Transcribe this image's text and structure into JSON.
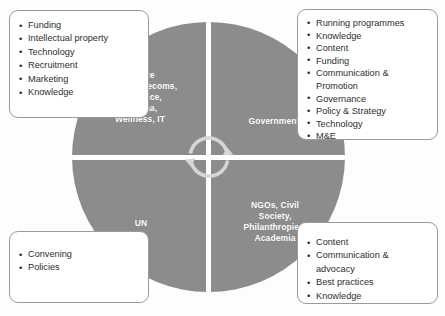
{
  "diagram": {
    "circle_color": "#8c8c8c",
    "divider_color": "#ffffff",
    "center_icon": "cycle-arrows-icon"
  },
  "quadrants": {
    "private_sector": {
      "label": "Private\nSector:",
      "line1": "Private",
      "line2": "Sector:",
      "members": "Telecoms,\nInsurance,\nPharma,\nWellness, IT",
      "m1": "Telecoms,",
      "m2": "Insurance,",
      "m3": "Pharma,",
      "m4": "Wellness, IT"
    },
    "government": {
      "label": "Government"
    },
    "un": {
      "label": "UN"
    },
    "ngos": {
      "l1": "NGOs, Civil",
      "l2": "Society,",
      "l3": "Philanthropies,",
      "l4": "Academia"
    }
  },
  "boxes": {
    "private_sector_contributions": {
      "items": [
        {
          "text": "Funding"
        },
        {
          "text": "Intellectual property"
        },
        {
          "text": "Technology"
        },
        {
          "text": "Recruitment"
        },
        {
          "text": "Marketing"
        },
        {
          "text": "Knowledge"
        }
      ]
    },
    "government_contributions": {
      "items": [
        {
          "text": "Running programmes"
        },
        {
          "text": "Knowledge"
        },
        {
          "text": "Content"
        },
        {
          "text": "Funding"
        },
        {
          "text": "Communication &",
          "cont": "Promotion"
        },
        {
          "text": "Governance"
        },
        {
          "text": "Policy & Strategy"
        },
        {
          "text": "Technology"
        },
        {
          "text": "M&E"
        }
      ]
    },
    "un_contributions": {
      "items": [
        {
          "text": "Convening"
        },
        {
          "text": "Policies"
        }
      ]
    },
    "ngo_contributions": {
      "items": [
        {
          "text": "Content"
        },
        {
          "text": "Communication &",
          "cont": "advocacy"
        },
        {
          "text": "Best practices"
        },
        {
          "text": "Knowledge"
        }
      ]
    }
  }
}
